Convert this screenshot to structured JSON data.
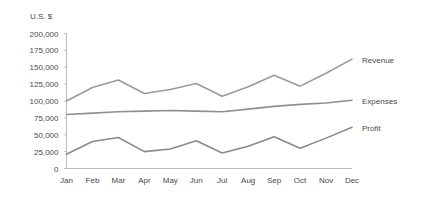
{
  "chart_data": {
    "type": "line",
    "title": "",
    "ylabel": "U.S. $",
    "xlabel": "",
    "categories": [
      "Jan",
      "Feb",
      "Mar",
      "Apr",
      "May",
      "Jun",
      "Jul",
      "Aug",
      "Sep",
      "Oct",
      "Nov",
      "Dec"
    ],
    "ylim": [
      0,
      200000
    ],
    "ytick_values": [
      0,
      25000,
      50000,
      75000,
      100000,
      125000,
      150000,
      175000,
      200000
    ],
    "ytick_labels": [
      "0",
      "25,000",
      "50,000",
      "75,000",
      "100,000",
      "125,000",
      "150,000",
      "175,000",
      "200,000"
    ],
    "grid": false,
    "legend_position": "right-inline",
    "series": [
      {
        "name": "Revenue",
        "color": "#9a9a9a",
        "values": [
          100000,
          120000,
          131000,
          111000,
          117000,
          126000,
          107000,
          121000,
          138000,
          122000,
          141000,
          162000
        ]
      },
      {
        "name": "Expenses",
        "color": "#8f8f8f",
        "values": [
          80000,
          82000,
          84000,
          85000,
          86000,
          85000,
          84000,
          88000,
          92000,
          95000,
          97000,
          101000
        ]
      },
      {
        "name": "Profit",
        "color": "#8a8a8a",
        "values": [
          21000,
          40000,
          46000,
          25000,
          29000,
          41000,
          23000,
          33000,
          47000,
          30000,
          45000,
          61000
        ]
      }
    ]
  },
  "axis": {
    "axis_color": "#b9b9b9"
  }
}
